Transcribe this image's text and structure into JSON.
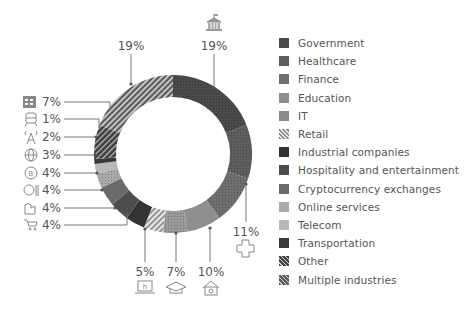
{
  "chart_data": {
    "type": "pie",
    "variant": "donut",
    "title": "",
    "categories": [
      "Government",
      "Healthcare",
      "Finance",
      "Education",
      "IT",
      "Retail",
      "Industrial companies",
      "Hospitality and entertainment",
      "Cryptocurrency exchanges",
      "Online services",
      "Telecom",
      "Transportation",
      "Other",
      "Multiple industries"
    ],
    "values": [
      19,
      11,
      10,
      7,
      5,
      4,
      4,
      4,
      4,
      3,
      2,
      1,
      7,
      19
    ],
    "unit": "%",
    "legend_position": "right",
    "start_angle_deg": 0,
    "direction": "clockwise"
  },
  "segments": [
    {
      "name": "Government",
      "value": 19,
      "label": "19%",
      "color": "#4a4a4a",
      "pattern": "dots",
      "icon": "government-building-icon"
    },
    {
      "name": "Healthcare",
      "value": 11,
      "label": "11%",
      "color": "#5e5e5e",
      "pattern": "dots",
      "icon": "medical-cross-icon"
    },
    {
      "name": "Finance",
      "value": 10,
      "label": "10%",
      "color": "#6f6f6f",
      "pattern": "dots",
      "icon": "bank-icon"
    },
    {
      "name": "Education",
      "value": 7,
      "label": "7%",
      "color": "#8e8e8e",
      "pattern": "none",
      "icon": "graduation-cap-icon"
    },
    {
      "name": "IT",
      "value": 5,
      "label": "5%",
      "color": "#9a9a9a",
      "pattern": "dots",
      "icon": "laptop-icon"
    },
    {
      "name": "Retail",
      "value": 4,
      "label": "4%",
      "color": "#9b9b9b",
      "pattern": "stripes-light",
      "icon": "shopping-cart-icon"
    },
    {
      "name": "Industrial companies",
      "value": 4,
      "label": "4%",
      "color": "#333333",
      "pattern": "none",
      "icon": "factory-icon"
    },
    {
      "name": "Hospitality and entertainment",
      "value": 4,
      "label": "4%",
      "color": "#4d4d4d",
      "pattern": "none",
      "icon": "fork-knife-icon"
    },
    {
      "name": "Cryptocurrency exchanges",
      "value": 4,
      "label": "4%",
      "color": "#6a6a6a",
      "pattern": "none",
      "icon": "bitcoin-icon"
    },
    {
      "name": "Online services",
      "value": 3,
      "label": "3%",
      "color": "#aaaaaa",
      "pattern": "dots",
      "icon": "globe-icon"
    },
    {
      "name": "Telecom",
      "value": 2,
      "label": "2%",
      "color": "#b8b8b8",
      "pattern": "none",
      "icon": "antenna-tower-icon"
    },
    {
      "name": "Transportation",
      "value": 1,
      "label": "1%",
      "color": "#3a3a3a",
      "pattern": "none",
      "icon": "train-icon"
    },
    {
      "name": "Other",
      "value": 7,
      "label": "7%",
      "color": "#444444",
      "pattern": "stripes-dark",
      "icon": "building-grid-icon"
    },
    {
      "name": "Multiple industries",
      "value": 19,
      "label": "19%",
      "color": "#5a5a5a",
      "pattern": "stripes-dense",
      "icon": ""
    }
  ],
  "legend": {
    "items": [
      {
        "label": "Government",
        "color": "#4a4a4a",
        "pattern": "none"
      },
      {
        "label": "Healthcare",
        "color": "#5e5e5e",
        "pattern": "none"
      },
      {
        "label": "Finance",
        "color": "#6f6f6f",
        "pattern": "none"
      },
      {
        "label": "Education",
        "color": "#8e8e8e",
        "pattern": "none"
      },
      {
        "label": "IT",
        "color": "#9a9a9a",
        "pattern": "dots"
      },
      {
        "label": "Retail",
        "color": "#9b9b9b",
        "pattern": "stripes-light"
      },
      {
        "label": "Industrial companies",
        "color": "#333333",
        "pattern": "none"
      },
      {
        "label": "Hospitality and entertainment",
        "color": "#4d4d4d",
        "pattern": "none"
      },
      {
        "label": "Cryptocurrency exchanges",
        "color": "#6a6a6a",
        "pattern": "none"
      },
      {
        "label": "Online services",
        "color": "#aaaaaa",
        "pattern": "none"
      },
      {
        "label": "Telecom",
        "color": "#b8b8b8",
        "pattern": "none"
      },
      {
        "label": "Transportation",
        "color": "#3a3a3a",
        "pattern": "none"
      },
      {
        "label": "Other",
        "color": "#444444",
        "pattern": "stripes-dark"
      },
      {
        "label": "Multiple industries",
        "color": "#5a5a5a",
        "pattern": "stripes-dense"
      }
    ]
  },
  "callouts": {
    "top_left": {
      "label": "19%"
    },
    "top_right": {
      "label": "19%"
    },
    "right": {
      "label": "11%"
    },
    "bottom": [
      {
        "label": "5%"
      },
      {
        "label": "7%"
      },
      {
        "label": "10%"
      }
    ],
    "left": [
      {
        "label": "7%"
      },
      {
        "label": "1%"
      },
      {
        "label": "2%"
      },
      {
        "label": "3%"
      },
      {
        "label": "4%"
      },
      {
        "label": "4%"
      },
      {
        "label": "4%"
      },
      {
        "label": "4%"
      }
    ]
  }
}
